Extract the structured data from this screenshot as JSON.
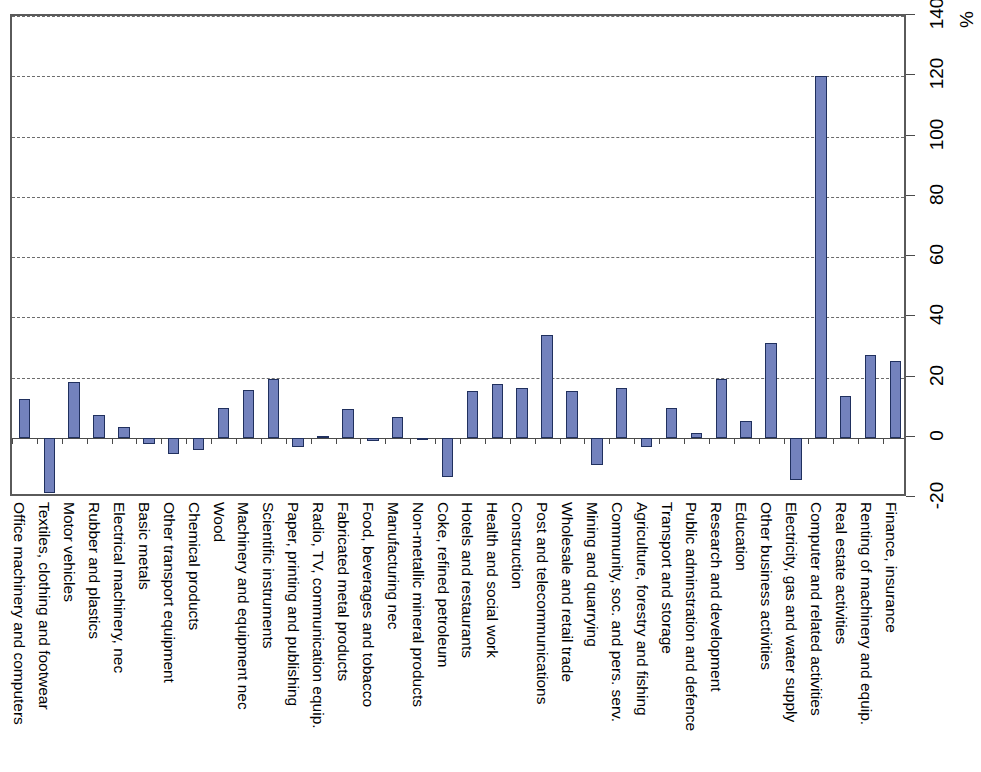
{
  "chart_data": {
    "type": "bar",
    "title": "",
    "subtitle": "",
    "xlabel": "",
    "ylabel": "",
    "unit_label": "%",
    "orientation": "vertical-bars-rotated-90",
    "grid": true,
    "legend": null,
    "ylim": [
      -20,
      140
    ],
    "ytick_step": 20,
    "ytick_labels": [
      "-20",
      "0",
      "20",
      "40",
      "60",
      "80",
      "100",
      "120",
      "140"
    ],
    "ytick_values": [
      -20,
      0,
      20,
      40,
      60,
      80,
      100,
      120,
      140
    ],
    "bar_color": "#7382bd",
    "bar_border_color": "#20305e",
    "grid_color": "#6b6b6b",
    "axis_color": "#4a4a4a",
    "categories": [
      "Office machinery and computers",
      "Textiles, clothing and footwear",
      "Motor vehicles",
      "Rubber and plastics",
      "Electrical machinery, nec",
      "Basic metals",
      "Other transport equipment",
      "Chemical products",
      "Wood",
      "Machinery and equipment nec",
      "Scientific instruments",
      "Paper, printing and publishing",
      "Radio, TV, communication equip.",
      "Fabricated metal products",
      "Food, beverages and tobacco",
      "Manufacturing nec",
      "Non-metallic mineral products",
      "Coke, refined petroleum",
      "Hotels and restaurants",
      "Health and social work",
      "Construction",
      "Post and telecommunications",
      "Wholesale and retail trade",
      "Mining and quarrying",
      "Community, soc. and pers. serv.",
      "Agriculture, forestry and fishing",
      "Transport and storage",
      "Public adminstration and defence",
      "Research and development",
      "Education",
      "Other business activities",
      "Electricity, gas and water supply",
      "Computer and related activities",
      "Real estate activities",
      "Renting of machinery and equip.",
      "Finance, insurance"
    ],
    "values": [
      13,
      -18.5,
      18.5,
      7.5,
      3.5,
      -2,
      -5.5,
      -4,
      10,
      16,
      19.5,
      -3,
      0.5,
      9.5,
      -1,
      7,
      0,
      -13,
      15.5,
      18,
      16.5,
      34,
      15.5,
      -9,
      16.5,
      -3,
      10,
      1.5,
      19.5,
      5.5,
      31.5,
      -14,
      120,
      14,
      27.5,
      25.5
    ]
  }
}
